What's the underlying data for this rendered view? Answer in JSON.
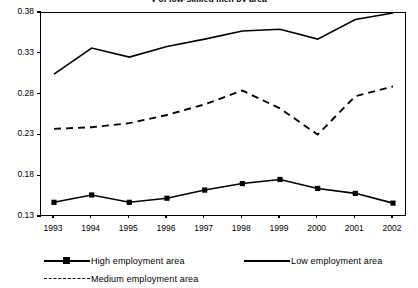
{
  "chart_data": {
    "type": "line",
    "title": "y of low-skilled men by area",
    "xlabel": "",
    "ylabel": "",
    "x": [
      1993,
      1994,
      1995,
      1996,
      1997,
      1998,
      1999,
      2000,
      2001,
      2002
    ],
    "x_tick_labels": [
      "1993",
      "1994",
      "1995",
      "1996",
      "1997",
      "1998",
      "1999",
      "2000",
      "2001",
      "2002"
    ],
    "y_tick_labels": [
      "0.38",
      "0.33",
      "0.28",
      "0.23",
      "0.18",
      "0.13"
    ],
    "y_ticks": [
      0.38,
      0.33,
      0.28,
      0.23,
      0.18,
      0.13
    ],
    "ylim": [
      0.13,
      0.38
    ],
    "xlim": [
      1992.6,
      11.4
    ],
    "grid": false,
    "legend_position": "bottom",
    "series": [
      {
        "name": "High employment area",
        "style": "solid-with-square-markers",
        "color": "#000000",
        "values": [
          0.148,
          0.157,
          0.148,
          0.153,
          0.163,
          0.171,
          0.176,
          0.165,
          0.159,
          0.147
        ]
      },
      {
        "name": "Medium employment area",
        "style": "dashed",
        "color": "#000000",
        "values": [
          0.238,
          0.24,
          0.245,
          0.255,
          0.268,
          0.285,
          0.263,
          0.231,
          0.278,
          0.29
        ]
      },
      {
        "name": "Low employment area",
        "style": "solid",
        "color": "#000000",
        "values": [
          0.305,
          0.337,
          0.326,
          0.339,
          0.348,
          0.358,
          0.36,
          0.348,
          0.372,
          0.38
        ]
      }
    ]
  },
  "legend": {
    "high_label": "High employment area",
    "medium_label": "Medium employment area",
    "low_label": "Low employment area"
  }
}
